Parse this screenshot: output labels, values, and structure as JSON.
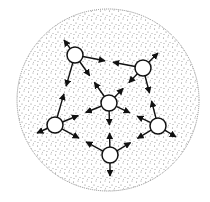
{
  "diagram": {
    "type": "network-graph",
    "boundary": {
      "shape": "circle",
      "cx": 108,
      "cy": 100,
      "r": 91,
      "fill": "stippled-gray",
      "stroke": "#888888"
    },
    "node_radius": 8,
    "nodes": [
      {
        "id": "A",
        "label": "",
        "x": 75,
        "y": 55
      },
      {
        "id": "B",
        "label": "",
        "x": 143,
        "y": 68
      },
      {
        "id": "C",
        "label": "",
        "x": 109,
        "y": 103
      },
      {
        "id": "D",
        "label": "",
        "x": 55,
        "y": 125
      },
      {
        "id": "E",
        "label": "",
        "x": 158,
        "y": 126
      },
      {
        "id": "F",
        "label": "",
        "x": 110,
        "y": 155
      }
    ],
    "edges": [
      {
        "from": "A",
        "to": "B",
        "style": "bidirectional-to-midpoint"
      },
      {
        "from": "B",
        "to": "E",
        "style": "bidirectional-to-midpoint"
      },
      {
        "from": "A",
        "to": "D",
        "style": "bidirectional-to-midpoint"
      },
      {
        "from": "A",
        "to": "C",
        "style": "bidirectional-to-midpoint"
      },
      {
        "from": "B",
        "to": "C",
        "style": "bidirectional-to-midpoint"
      },
      {
        "from": "C",
        "to": "D",
        "style": "bidirectional-to-midpoint"
      },
      {
        "from": "C",
        "to": "E",
        "style": "bidirectional-to-midpoint"
      },
      {
        "from": "C",
        "to": "F",
        "style": "bidirectional-to-midpoint"
      },
      {
        "from": "D",
        "to": "F",
        "style": "bidirectional-to-midpoint"
      },
      {
        "from": "E",
        "to": "F",
        "style": "bidirectional-to-midpoint"
      }
    ],
    "outward_stubs": [
      {
        "from": "A",
        "x2": 64,
        "y2": 40
      },
      {
        "from": "B",
        "x2": 158,
        "y2": 53
      },
      {
        "from": "D",
        "x2": 37,
        "y2": 133
      },
      {
        "from": "E",
        "x2": 176,
        "y2": 137
      },
      {
        "from": "F",
        "x2": 110,
        "y2": 176
      }
    ],
    "colors": {
      "line": "#111111",
      "node_fill": "#ffffff",
      "dot": "#7a7a7a",
      "boundary": "#8a8a8a"
    }
  }
}
